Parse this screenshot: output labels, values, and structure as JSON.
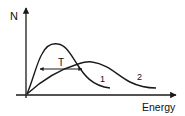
{
  "diagram": {
    "y_axis_label": "N",
    "x_axis_label": "Energy",
    "curves": [
      {
        "label": "1",
        "description": "narrow, taller distribution peaking at lower energy"
      },
      {
        "label": "2",
        "description": "broader, lower distribution peaking at higher energy"
      }
    ],
    "width_marker": {
      "label": "T",
      "description": "double-headed arrow marking width of curve 1 at intersection height"
    },
    "colors": {
      "line": "#1a1a1a",
      "background": "#ffffff"
    }
  }
}
